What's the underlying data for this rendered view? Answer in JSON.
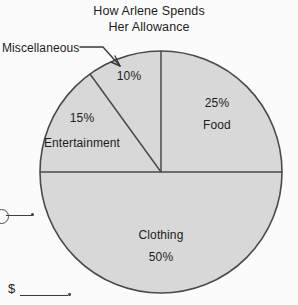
{
  "chart_data": {
    "type": "pie",
    "title_line1": "How Arlene Spends",
    "title_line2": "Her Allowance",
    "categories": [
      "Food",
      "Clothing",
      "Entertainment",
      "Miscellaneous"
    ],
    "values": [
      25,
      50,
      15,
      10
    ],
    "value_labels": [
      "25%",
      "50%",
      "15%",
      "10%"
    ],
    "unit": "percent",
    "total": 100,
    "legend": "none",
    "grid": false,
    "slice_fill": "#d8d8d8",
    "slice_stroke": "#4a4a4a",
    "background": "#fbfbfb",
    "start_angle_deg": 0,
    "direction": "clockwise",
    "slices": [
      {
        "name": "Food",
        "percent": 25,
        "percent_label": "25%",
        "label": "Food",
        "label_placement": "inside",
        "start_deg": 0,
        "end_deg": 90
      },
      {
        "name": "Clothing",
        "percent": 50,
        "percent_label": "50%",
        "label": "Clothing",
        "label_placement": "inside",
        "start_deg": 90,
        "end_deg": 270
      },
      {
        "name": "Entertainment",
        "percent": 15,
        "percent_label": "15%",
        "label": "Entertainment",
        "label_placement": "inside",
        "start_deg": 270,
        "end_deg": 324
      },
      {
        "name": "Miscellaneous",
        "percent": 10,
        "percent_label": "10%",
        "label": "Miscellaneous",
        "label_placement": "callout",
        "start_deg": 324,
        "end_deg": 360
      }
    ]
  },
  "labels": {
    "food_percent": "25%",
    "food_name": "Food",
    "clothing_name": "Clothing",
    "clothing_percent": "50%",
    "entertainment_percent": "15%",
    "entertainment_name": "Entertainment",
    "misc_percent": "10%",
    "misc_callout": "Miscellaneous"
  },
  "worksheet": {
    "answer_prefix": "$"
  }
}
